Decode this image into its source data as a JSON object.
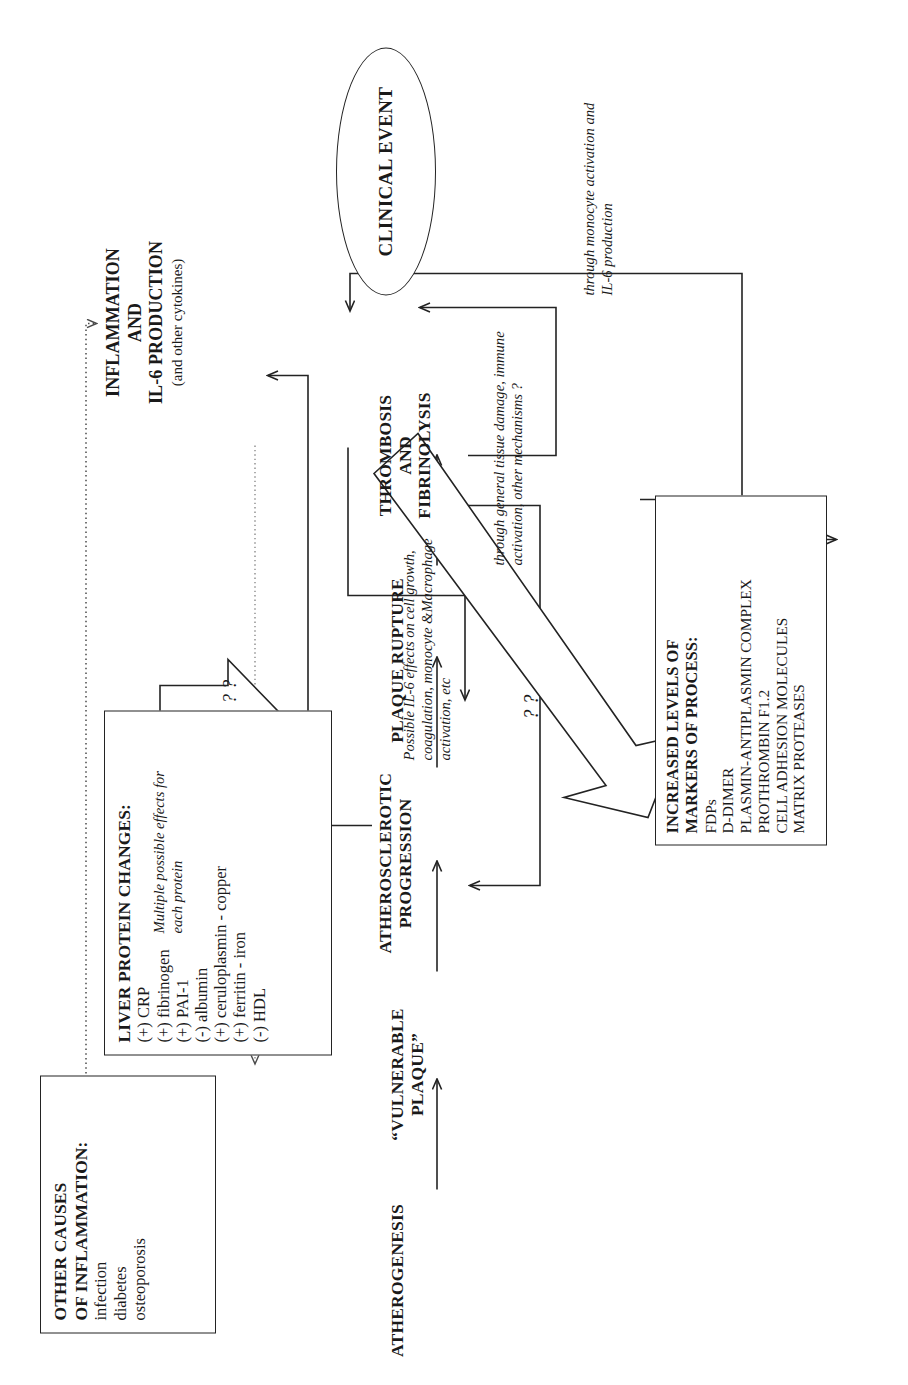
{
  "figure": {
    "orientation": "rotated-90",
    "line_color": "#232323"
  },
  "other_causes": {
    "header": "OTHER CAUSES",
    "header2": "OF INFLAMMATION:",
    "items": [
      "infection",
      "diabetes",
      "osteoporosis"
    ]
  },
  "liver_protein": {
    "header": "LIVER PROTEIN CHANGES:",
    "items": [
      "(+) CRP",
      "(+) fibrinogen",
      "(+) PAI-1",
      "(-) albumin",
      "(+) ceruloplasmin - copper",
      "(+) ferritin - iron",
      "(-) HDL"
    ]
  },
  "inflammation": {
    "line1": "INFLAMMATION",
    "line2": "AND",
    "line3": "IL-6 PRODUCTION",
    "sub": "(and other cytokines)"
  },
  "markers": {
    "header1": "INCREASED LEVELS OF",
    "header2": "MARKERS OF PROCESS:",
    "items": [
      "FDPs",
      "D-DIMER",
      "PLASMIN-ANTIPLASMIN COMPLEX",
      "PROTHROMBIN F1.2",
      "CELL ADHESION MOLECULES",
      "MATRIX PROTEASES"
    ]
  },
  "stages": {
    "atherogenesis": "ATHEROGENESIS",
    "vulnerable_plaque": "“VULNERABLE PLAQUE”",
    "atherosclerotic_progression_1": "ATHEROSCLEROTIC",
    "atherosclerotic_progression_2": "PROGRESSION",
    "plaque_rupture": "PLAQUE RUPTURE",
    "thrombosis_1": "THROMBOSIS",
    "thrombosis_2": "AND",
    "thrombosis_3": "FIBRINOLYSIS",
    "clinical_event": "CLINICAL EVENT"
  },
  "notes": {
    "multiple_effects": "Multiple possible effects for each protein",
    "il6_effects": "Possible IL-6 effects on cell growth, coagulation, monocyte &Macrophage activation, etc",
    "tissue_damage": "through general tissue damage, immune activation, other mechanisms ?",
    "monocyte": "through monocyte activation and IL-6 production",
    "question_small": "? ?",
    "question_big": "? ?"
  }
}
